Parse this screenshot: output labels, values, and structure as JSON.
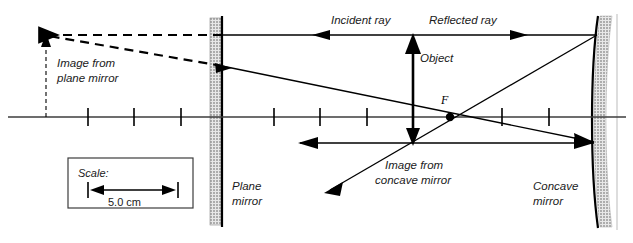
{
  "figure": {
    "type": "optics-ray-diagram",
    "background_color": "#ffffff",
    "line_color": "#000000",
    "axis_color": "#3d3d3d",
    "width": 633,
    "height": 243
  },
  "labels": {
    "image_plane_mirror_line1": "Image from",
    "image_plane_mirror_line2": "plane mirror",
    "incident_ray": "Incident ray",
    "reflected_ray": "Reflected ray",
    "object": "Object",
    "focal_point": "F",
    "image_concave_line1": "Image from",
    "image_concave_line2": "concave mirror",
    "plane_mirror_line1": "Plane",
    "plane_mirror_line2": "mirror",
    "concave_mirror_line1": "Concave",
    "concave_mirror_line2": "mirror"
  },
  "scale_box": {
    "caption": "Scale:",
    "value": "5.0 cm"
  },
  "geometry": {
    "optical_axis_y": 117,
    "axis_x_start": 8,
    "axis_x_end": 626,
    "tick_positions_x": [
      88,
      134,
      181,
      274,
      320,
      367,
      413,
      502,
      549
    ],
    "tick_half_height": 9,
    "plane_mirror_x": 222,
    "concave_mirror_x": 595,
    "focal_point_x": 450,
    "focal_point_y": 117,
    "object_x": 413,
    "object_top_y": 38,
    "image_concave_bottom_y": 143,
    "virtual_image_x": 46,
    "virtual_image_top_y": 35,
    "upper_ray_y": 35,
    "lower_ray_left_y": 143,
    "lower_ray_right_y": 143
  }
}
